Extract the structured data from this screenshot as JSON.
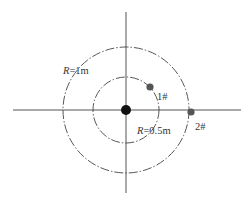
{
  "diagram": {
    "center": {
      "x": 126,
      "y": 110
    },
    "axes": {
      "horizontal": {
        "x1": 13,
        "x2": 241,
        "y": 110
      },
      "vertical": {
        "y1": 12,
        "y2": 193,
        "x": 126
      }
    },
    "circles": [
      {
        "name": "outer",
        "radius_label_var": "R",
        "radius_label_value": "=1m",
        "r_px": 63
      },
      {
        "name": "inner",
        "radius_label_var": "R",
        "radius_label_value": "=0.5m",
        "r_px": 33
      }
    ],
    "points": [
      {
        "id": "center",
        "label": "",
        "x": 126,
        "y": 110
      },
      {
        "id": "1",
        "label": "1#",
        "x": 150,
        "y": 87
      },
      {
        "id": "2",
        "label": "2#",
        "x": 191,
        "y": 112
      }
    ],
    "colors": {
      "line": "#444444",
      "center_point": "#111111",
      "measure_point": "#555555"
    }
  }
}
